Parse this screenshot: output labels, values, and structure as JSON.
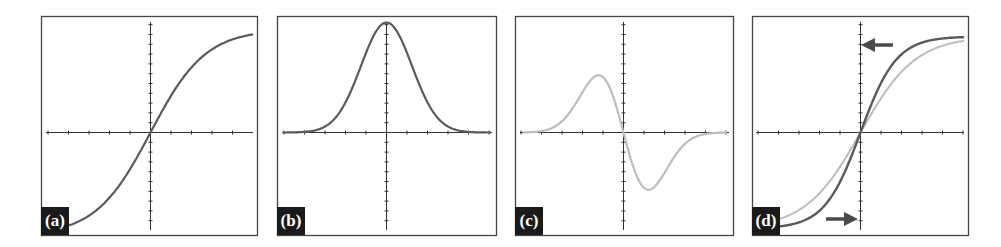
{
  "figure": {
    "colors": {
      "dark_curve": "#5a5a5a",
      "light_curve": "#bdbdbd",
      "axis": "#333333",
      "border": "#444444",
      "label_bg": "#1a1a1a",
      "label_text": "#ffffff"
    },
    "panels": [
      {
        "id": "a",
        "label": "(a)",
        "curve": "sigmoid",
        "style": "dark"
      },
      {
        "id": "b",
        "label": "(b)",
        "curve": "gaussian-bell",
        "style": "dark"
      },
      {
        "id": "c",
        "label": "(c)",
        "curve": "negative-derivative-of-gaussian",
        "style": "light"
      },
      {
        "id": "d",
        "label": "(d)",
        "curves": [
          "steep-sigmoid (dark)",
          "shallow-sigmoid (light)"
        ],
        "arrows": [
          "left-pointing near top",
          "right-pointing near bottom"
        ]
      }
    ]
  }
}
